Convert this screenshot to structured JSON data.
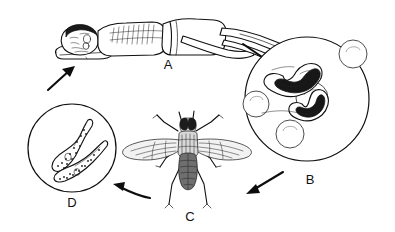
{
  "figure": {
    "background_color": "#ffffff",
    "ink_color": "#101010",
    "style": "black-and-white line drawing"
  },
  "stages": [
    {
      "id": "A",
      "label": "A",
      "label_x": 168,
      "label_y": 69,
      "subject": "sleeping human patient lying on pillow",
      "description": "Infected person lying on side asleep, representing the human host"
    },
    {
      "id": "B",
      "label": "B",
      "label_x": 310,
      "label_y": 184,
      "subject": "trypanosomes in human blood smear",
      "circle_cx": 307,
      "circle_cy": 99,
      "circle_r": 62,
      "blood_cell_count": 4,
      "parasite_count": 2,
      "description": "Magnified blood view showing trypanosomes among red blood cells"
    },
    {
      "id": "C",
      "label": "C",
      "label_x": 190,
      "label_y": 221,
      "subject": "tsetse fly vector",
      "description": "Tsetse fly (Glossina) shown dorsally with outspread wings"
    },
    {
      "id": "D",
      "label": "D",
      "label_x": 72,
      "label_y": 207,
      "subject": "trypanosomes in fly gut",
      "circle_cx": 72,
      "circle_cy": 148,
      "circle_r": 44,
      "parasite_count": 2,
      "description": "Magnified view of two stippled trypanosomes in the insect vector"
    }
  ],
  "arrows": [
    {
      "id": "arrow-d-to-a",
      "from": "D",
      "to": "A",
      "direction": "up-right",
      "style": "straight"
    },
    {
      "id": "arrow-a-to-b",
      "from": "A",
      "to": "B",
      "direction": "down-right",
      "style": "straight"
    },
    {
      "id": "arrow-b-to-c",
      "from": "B",
      "to": "C",
      "direction": "down-left",
      "style": "straight"
    },
    {
      "id": "arrow-c-to-d",
      "from": "C",
      "to": "D",
      "direction": "left",
      "style": "curved"
    }
  ]
}
